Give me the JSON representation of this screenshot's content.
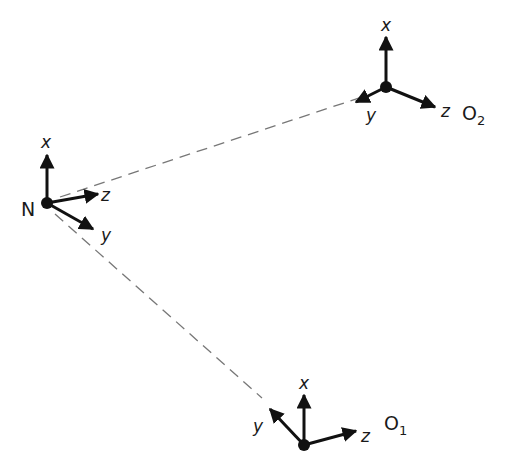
{
  "diagram": {
    "type": "coordinate-frames",
    "colors": {
      "ink": "#111111",
      "dash": "#777777",
      "background": "#ffffff"
    },
    "frames": [
      {
        "id": "N",
        "label": "N",
        "subscript": "",
        "origin": [
          47,
          203
        ],
        "axes": {
          "x": {
            "label": "x",
            "tip": [
              47,
              155
            ]
          },
          "z": {
            "label": "z",
            "tip": [
              98,
              194
            ]
          },
          "y": {
            "label": "y",
            "tip": [
              93,
              229
            ]
          }
        }
      },
      {
        "id": "O2",
        "label": "O",
        "subscript": "2",
        "origin": [
          386,
          87
        ],
        "axes": {
          "x": {
            "label": "x",
            "tip": [
              386,
              37
            ]
          },
          "z": {
            "label": "z",
            "tip": [
              435,
              107
            ]
          },
          "y": {
            "label": "y",
            "tip": [
              356,
              102
            ]
          }
        }
      },
      {
        "id": "O1",
        "label": "O",
        "subscript": "1",
        "origin": [
          304,
          445
        ],
        "axes": {
          "x": {
            "label": "x",
            "tip": [
              304,
              395
            ]
          },
          "z": {
            "label": "z",
            "tip": [
              356,
              431
            ]
          },
          "y": {
            "label": "y",
            "tip": [
              270,
              409
            ]
          }
        }
      }
    ],
    "connections": [
      {
        "from": "N",
        "to": "O2",
        "style": "dashed"
      },
      {
        "from": "N",
        "to": "O1",
        "style": "dashed"
      }
    ]
  }
}
